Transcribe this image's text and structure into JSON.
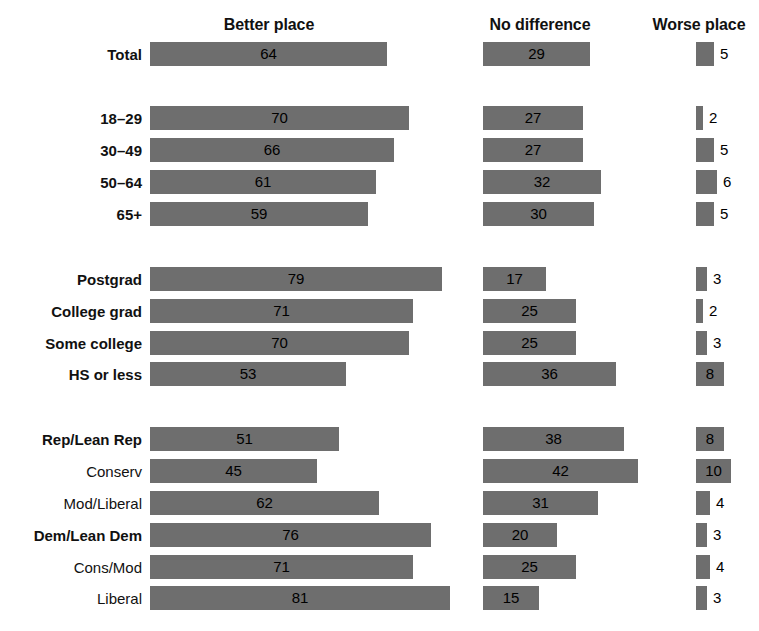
{
  "chart_data": {
    "type": "bar",
    "title": "",
    "subtitle": "",
    "xlabel": "",
    "ylabel": "",
    "orientation": "horizontal",
    "grid": false,
    "legend_position": "top (column headers)",
    "xlim": [
      0,
      100
    ],
    "units": "percent",
    "columns": [
      {
        "key": "better",
        "label": "Better place"
      },
      {
        "key": "nodiff",
        "label": "No difference"
      },
      {
        "key": "worse",
        "label": "Worse place"
      }
    ],
    "categories": [
      "Total",
      "18–29",
      "30–49",
      "50–64",
      "65+",
      "Postgrad",
      "College grad",
      "Some college",
      "HS or less",
      "Rep/Lean Rep",
      "Conserv",
      "Mod/Liberal",
      "Dem/Lean Dem",
      "Cons/Mod",
      "Liberal"
    ],
    "series": [
      {
        "name": "Better place",
        "values": [
          64,
          70,
          66,
          61,
          59,
          79,
          71,
          70,
          53,
          51,
          45,
          62,
          76,
          71,
          81
        ]
      },
      {
        "name": "No difference",
        "values": [
          29,
          27,
          27,
          32,
          30,
          17,
          25,
          25,
          36,
          38,
          42,
          31,
          20,
          25,
          15
        ]
      },
      {
        "name": "Worse place",
        "values": [
          5,
          2,
          5,
          6,
          5,
          3,
          2,
          3,
          8,
          8,
          10,
          4,
          3,
          4,
          3
        ]
      }
    ],
    "colors": {
      "bar": "#6e6e6e",
      "text": "#111111",
      "background": "#ffffff"
    },
    "groups": [
      {
        "name": "total",
        "rows": [
          {
            "label": "Total",
            "bold": true,
            "better": 64,
            "nodiff": 29,
            "worse": 5,
            "top": 42
          }
        ]
      },
      {
        "name": "age",
        "rows": [
          {
            "label": "18–29",
            "bold": true,
            "better": 70,
            "nodiff": 27,
            "worse": 2,
            "top": 106
          },
          {
            "label": "30–49",
            "bold": true,
            "better": 66,
            "nodiff": 27,
            "worse": 5,
            "top": 138
          },
          {
            "label": "50–64",
            "bold": true,
            "better": 61,
            "nodiff": 32,
            "worse": 6,
            "top": 170
          },
          {
            "label": "65+",
            "bold": true,
            "better": 59,
            "nodiff": 30,
            "worse": 5,
            "top": 202
          }
        ]
      },
      {
        "name": "education",
        "rows": [
          {
            "label": "Postgrad",
            "bold": true,
            "better": 79,
            "nodiff": 17,
            "worse": 3,
            "top": 267
          },
          {
            "label": "College grad",
            "bold": true,
            "better": 71,
            "nodiff": 25,
            "worse": 2,
            "top": 299
          },
          {
            "label": "Some college",
            "bold": true,
            "better": 70,
            "nodiff": 25,
            "worse": 3,
            "top": 331
          },
          {
            "label": "HS or less",
            "bold": true,
            "better": 53,
            "nodiff": 36,
            "worse": 8,
            "top": 362
          }
        ]
      },
      {
        "name": "party-ideology",
        "rows": [
          {
            "label": "Rep/Lean Rep",
            "bold": true,
            "better": 51,
            "nodiff": 38,
            "worse": 8,
            "top": 427
          },
          {
            "label": "Conserv",
            "bold": false,
            "better": 45,
            "nodiff": 42,
            "worse": 10,
            "top": 459
          },
          {
            "label": "Mod/Liberal",
            "bold": false,
            "better": 62,
            "nodiff": 31,
            "worse": 4,
            "top": 491
          },
          {
            "label": "Dem/Lean Dem",
            "bold": true,
            "better": 76,
            "nodiff": 20,
            "worse": 3,
            "top": 523
          },
          {
            "label": "Cons/Mod",
            "bold": false,
            "better": 71,
            "nodiff": 25,
            "worse": 4,
            "top": 555
          },
          {
            "label": "Liberal",
            "bold": false,
            "better": 81,
            "nodiff": 15,
            "worse": 3,
            "top": 586
          }
        ]
      }
    ],
    "layout": {
      "col_better_x": 150,
      "col_nodiff_x": 483,
      "col_worse_x": 696,
      "px_per_unit_better": 3.7,
      "px_per_unit_nodiff": 3.7,
      "px_per_unit_worse": 3.5,
      "bar_height": 24,
      "inside_label_min_width": 22
    }
  }
}
